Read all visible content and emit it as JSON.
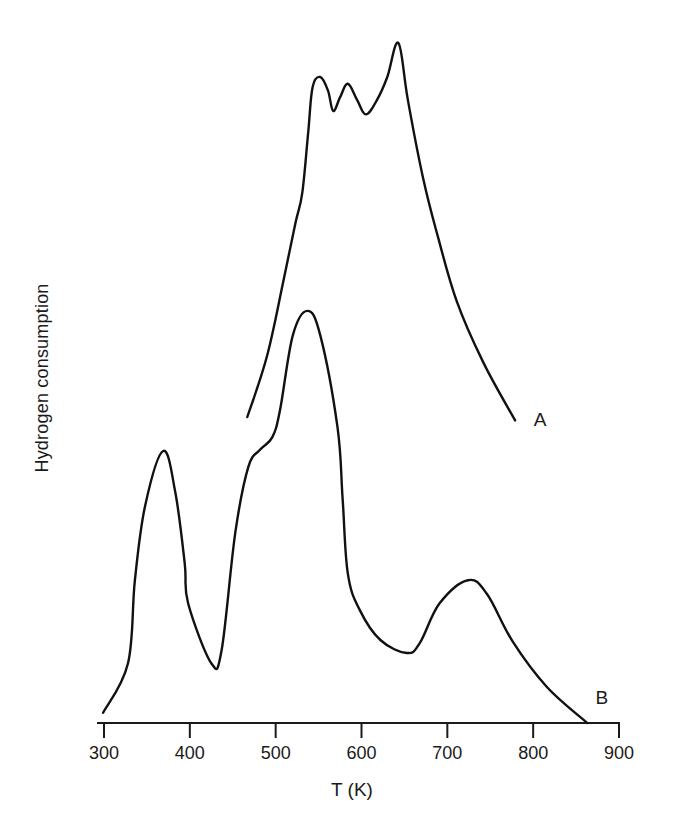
{
  "chart_data": {
    "type": "line",
    "title": "",
    "xlabel": "T (K)",
    "ylabel": "Hydrogen consumption",
    "xlim": [
      300,
      900
    ],
    "ylim": [
      0,
      100
    ],
    "y_units": "arbitrary (no y ticks shown)",
    "x_ticks": [
      300,
      400,
      500,
      600,
      700,
      800,
      900
    ],
    "x_tick_labels": [
      "300",
      "400",
      "500",
      "600",
      "700",
      "800",
      "900"
    ],
    "grid": false,
    "legend": "inline labels at curve ends (A, B)",
    "series": [
      {
        "name": "A",
        "label": "A",
        "x": [
          467,
          490,
          509,
          523,
          531,
          538,
          543,
          552,
          561,
          567,
          575,
          584,
          595,
          605,
          618,
          630,
          643,
          654,
          672,
          688,
          711,
          742,
          779
        ],
        "y": [
          45,
          54,
          65,
          73.5,
          78,
          87,
          93.5,
          95,
          93,
          90,
          92,
          94,
          91.6,
          89.5,
          91.6,
          95,
          100,
          91.6,
          80,
          72,
          62,
          53,
          44.5
        ]
      },
      {
        "name": "B",
        "label": "B",
        "x": [
          299,
          328,
          336,
          348,
          369,
          383,
          394,
          398,
          425,
          437,
          453,
          468,
          482,
          496,
          505,
          520,
          537,
          552,
          572,
          578,
          584,
          598,
          622,
          653,
          668,
          691,
          724,
          746,
          776,
          816,
          863
        ],
        "y": [
          1.5,
          8.8,
          21,
          32,
          40,
          34,
          23.5,
          17.6,
          8.8,
          10.7,
          28,
          37.6,
          40.2,
          42,
          46,
          57,
          60.6,
          57,
          43.5,
          33,
          22,
          16.6,
          12.2,
          10.3,
          11.8,
          17.6,
          21,
          19,
          12,
          5.3,
          0
        ]
      }
    ],
    "annotations": [
      {
        "text": "A",
        "x": 808,
        "y": 44.5
      },
      {
        "text": "B",
        "x": 880,
        "y": 3.7
      }
    ]
  }
}
